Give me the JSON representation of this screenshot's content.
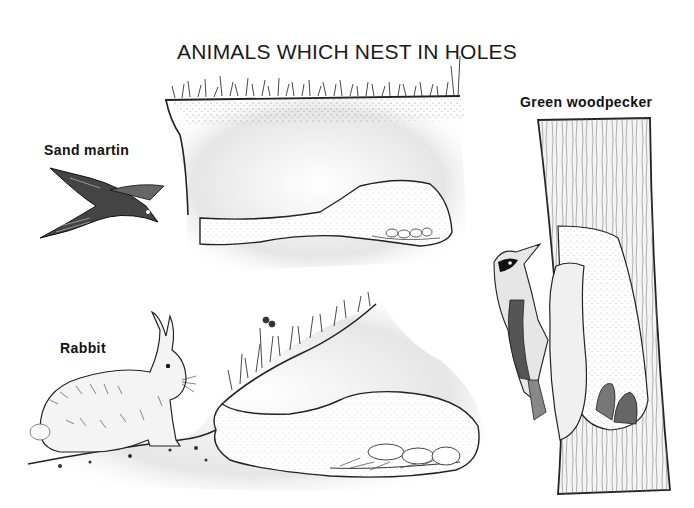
{
  "page": {
    "top_clipped_text": "",
    "title": "ANIMALS WHICH NEST IN HOLES"
  },
  "labels": {
    "sand_martin": "Sand martin",
    "green_woodpecker": "Green woodpecker",
    "rabbit": "Rabbit"
  },
  "illustrations": [
    {
      "name": "sand-martin-bird",
      "depicts": "Sand martin in flight"
    },
    {
      "name": "sand-martin-burrow",
      "depicts": "Cross-section of earth bank with long tunnel ending in nest chamber with eggs"
    },
    {
      "name": "rabbit",
      "depicts": "Rabbit crouching on mound"
    },
    {
      "name": "rabbit-burrow",
      "depicts": "Cross-section of rabbit burrow with young in grass nest"
    },
    {
      "name": "green-woodpecker",
      "depicts": "Green woodpecker clinging to tree trunk"
    },
    {
      "name": "tree-nest-hole",
      "depicts": "Cutaway tree trunk showing nest cavity with chicks"
    }
  ],
  "colors": {
    "ink": "#111111",
    "paper": "#ffffff",
    "soil": "#d9d9d9"
  }
}
